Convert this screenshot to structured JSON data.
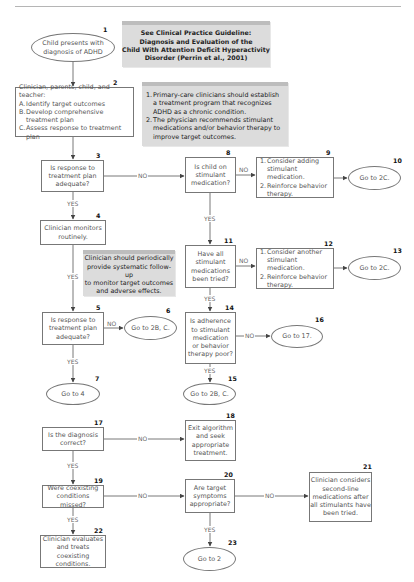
{
  "guideline_note": {
    "lines": [
      "See Clinical Practice Guideline:",
      "Diagnosis and Evaluation of the",
      "Child With Attention Deficit Hyperactivity",
      "Disorder (Perrin et al., 2001)"
    ]
  },
  "treatment_note": {
    "items": [
      {
        "marker": "1.",
        "text": "Primary-care clinicians should establish a treatment program that recognizes ADHD as a chronic condition."
      },
      {
        "marker": "2.",
        "text": "The physician recommends stimulant medications and/or behavior therapy to improve target outcomes."
      }
    ]
  },
  "followup_note": {
    "lines": [
      "Clinician should periodically",
      "provide systematic follow-up",
      "to monitor target outcomes",
      "and adverse effects."
    ]
  },
  "nodes": {
    "n1": {
      "num": "1",
      "lines": [
        "Child presents with",
        "diagnosis of ADHD"
      ]
    },
    "n2": {
      "num": "2",
      "title": "Clinician, parents, child, and teacher:",
      "items": [
        {
          "marker": "A.",
          "text": "Identify target outcomes"
        },
        {
          "marker": "B.",
          "text": "Develop comprehensive treatment plan"
        },
        {
          "marker": "C.",
          "text": "Assess response to treatment plan"
        }
      ]
    },
    "n3": {
      "num": "3",
      "lines": [
        "Is response to",
        "treatment plan",
        "adequate?"
      ]
    },
    "n4": {
      "num": "4",
      "lines": [
        "Clinician monitors",
        "routinely."
      ]
    },
    "n5": {
      "num": "5",
      "lines": [
        "Is response to",
        "treatment plan",
        "adequate?"
      ]
    },
    "n6": {
      "num": "6",
      "lines": [
        "Go to 2B, C."
      ]
    },
    "n7": {
      "num": "7",
      "lines": [
        "Go to 4"
      ]
    },
    "n8": {
      "num": "8",
      "lines": [
        "Is child on",
        "stimulant",
        "medication?"
      ]
    },
    "n9": {
      "num": "9",
      "items": [
        {
          "marker": "1.",
          "text": "Consider adding stimulant medication."
        },
        {
          "marker": "2.",
          "text": "Reinforce behavior therapy."
        }
      ]
    },
    "n10": {
      "num": "10",
      "lines": [
        "Go to 2C."
      ]
    },
    "n11": {
      "num": "11",
      "lines": [
        "Have all",
        "stimulant",
        "medications",
        "been tried?"
      ]
    },
    "n12": {
      "num": "12",
      "items": [
        {
          "marker": "1.",
          "text": "Consider another stimulant medication."
        },
        {
          "marker": "2.",
          "text": "Reinforce behavior therapy."
        }
      ]
    },
    "n13": {
      "num": "13",
      "lines": [
        "Go to 2C."
      ]
    },
    "n14": {
      "num": "14",
      "lines": [
        "Is adherence",
        "to stimulant",
        "medication",
        "or behavior",
        "therapy poor?"
      ]
    },
    "n15": {
      "num": "15",
      "lines": [
        "Go to 2B, C."
      ]
    },
    "n16": {
      "num": "16",
      "lines": [
        "Go to 17."
      ]
    },
    "n17": {
      "num": "17",
      "lines": [
        "Is the diagnosis",
        "correct?"
      ]
    },
    "n18": {
      "num": "18",
      "lines": [
        "Exit algorithm",
        "and seek",
        "appropriate",
        "treatment."
      ]
    },
    "n19": {
      "num": "19",
      "lines": [
        "Were coexisting",
        "conditions missed?"
      ]
    },
    "n20": {
      "num": "20",
      "lines": [
        "Are target",
        "symptoms",
        "appropriate?"
      ]
    },
    "n21": {
      "num": "21",
      "lines": [
        "Clinician considers",
        "second-line",
        "medications after",
        "all stimulants have",
        "been tried."
      ]
    },
    "n22": {
      "num": "22",
      "lines": [
        "Clinician evaluates",
        "and treats coexisting",
        "conditions."
      ]
    },
    "n23": {
      "num": "23",
      "lines": [
        "Go to 2"
      ]
    }
  },
  "edge_labels": {
    "yes": "YES",
    "no": "NO"
  },
  "colors": {
    "line": "#555555",
    "box_border": "#777777",
    "note_fill": "#dcdcdc",
    "note_top": "#bdbdbd"
  }
}
